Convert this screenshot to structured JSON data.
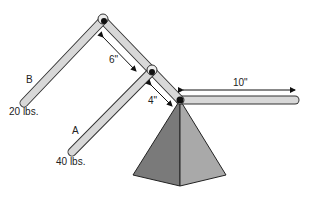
{
  "diagram": {
    "type": "lever-mechanism",
    "labels": {
      "arm_b": "B",
      "arm_a": "A",
      "weight_b": "20 lbs.",
      "weight_a": "40 lbs.",
      "dim_upper": "6\"",
      "dim_lower": "4\"",
      "dim_horizontal": "10\""
    },
    "colors": {
      "arm_fill": "#d8d8d8",
      "arm_stroke": "#333333",
      "pyramid_left": "#7a7a7a",
      "pyramid_right": "#a9a9a9",
      "joint": "#111111"
    }
  }
}
